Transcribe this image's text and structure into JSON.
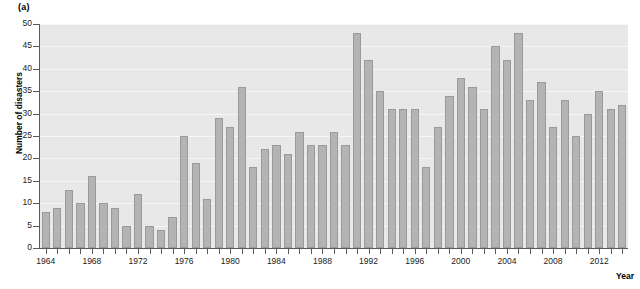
{
  "panel": {
    "label": "(a)"
  },
  "axes": {
    "ylabel": "Number of disasters",
    "xlabel": "Year",
    "y_ticks": [
      0,
      5,
      10,
      15,
      20,
      25,
      30,
      35,
      40,
      45,
      50
    ],
    "x_tick_labels": [
      "1964",
      "1968",
      "1972",
      "1976",
      "1980",
      "1984",
      "1988",
      "1992",
      "1996",
      "2000",
      "2004",
      "2008",
      "2012"
    ]
  },
  "style": {
    "bar_fill": "#b4b4b4",
    "bar_stroke": "#9a9a9a",
    "plot_background": "#e8e8e8",
    "gridline_color": "#f6f6f6",
    "axis_color": "#5a5a5a",
    "text_color": "#222222"
  },
  "chart_data": {
    "type": "bar",
    "title": "(a)",
    "xlabel": "Year",
    "ylabel": "Number of disasters",
    "ylim": [
      0,
      50
    ],
    "ytick_step": 5,
    "grid": true,
    "legend": null,
    "categories": [
      "1964",
      "1965",
      "1966",
      "1967",
      "1968",
      "1969",
      "1970",
      "1971",
      "1972",
      "1973",
      "1974",
      "1975",
      "1976",
      "1977",
      "1978",
      "1979",
      "1980",
      "1981",
      "1982",
      "1983",
      "1984",
      "1985",
      "1986",
      "1987",
      "1988",
      "1989",
      "1990",
      "1991",
      "1992",
      "1993",
      "1994",
      "1995",
      "1996",
      "1997",
      "1998",
      "1999",
      "2000",
      "2001",
      "2002",
      "2003",
      "2004",
      "2005",
      "2006",
      "2007",
      "2008",
      "2009",
      "2010",
      "2011",
      "2012",
      "2013",
      "2014"
    ],
    "values": [
      8,
      9,
      13,
      10,
      16,
      10,
      9,
      5,
      12,
      5,
      4,
      7,
      25,
      19,
      11,
      29,
      27,
      36,
      18,
      22,
      23,
      21,
      26,
      23,
      23,
      26,
      23,
      48,
      42,
      35,
      31,
      31,
      31,
      18,
      27,
      34,
      38,
      36,
      31,
      45,
      42,
      48,
      33,
      37,
      27,
      33,
      25,
      30,
      35,
      31,
      32
    ]
  }
}
